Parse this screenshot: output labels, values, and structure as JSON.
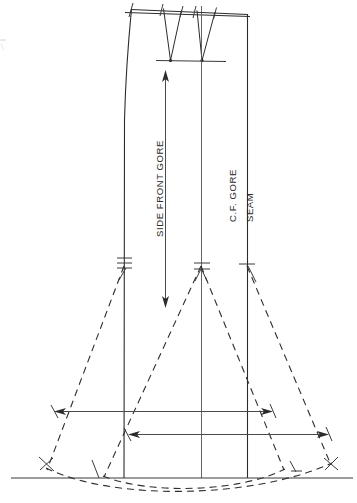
{
  "drawing": {
    "title": "Skirt Gore Pattern Draft",
    "type": "technical-sewing-pattern",
    "background_color": "#ffffff",
    "line_color": "#2b2b2b",
    "dashed_color": "#2e2e2e",
    "canvas": {
      "width": 357,
      "height": 503
    }
  },
  "labels": [
    {
      "id": "side-front-gore",
      "text": "SIDE FRONT GORE",
      "orientation": "vertical-up",
      "x": 163,
      "y": 237,
      "font_size": 9.5
    },
    {
      "id": "cf-gore",
      "text": "C.F. GORE",
      "orientation": "vertical-up",
      "x": 236,
      "y": 222,
      "font_size": 9.5
    },
    {
      "id": "seam",
      "text": "SEAM",
      "orientation": "vertical-up",
      "x": 253,
      "y": 222,
      "font_size": 9.5
    }
  ],
  "construction": {
    "waistline": {
      "y_left": 8,
      "y_right": 14,
      "x_left": 131,
      "x_right": 248
    },
    "hipline": {
      "y": 61,
      "x_left": 160,
      "x_right": 224
    },
    "baseline": {
      "y": 478,
      "x_left": 12,
      "x_right": 352
    },
    "vertical_lines": [
      {
        "id": "side-seam-line",
        "x": 124,
        "y_top": 10,
        "y_bottom": 478,
        "notches": 3
      },
      {
        "id": "side-front-gore-line",
        "x": 201,
        "y_top": 6,
        "y_bottom": 478,
        "notches": 2
      },
      {
        "id": "cf-gore-seam-line",
        "x": 247,
        "y_top": 14,
        "y_bottom": 478,
        "notches": 1
      }
    ],
    "darts": [
      {
        "id": "dart-left",
        "apex_x": 170,
        "apex_y": 61,
        "top_left_x": 163,
        "top_right_x": 181,
        "top_y": 8
      },
      {
        "id": "dart-right",
        "apex_x": 201,
        "apex_y": 61,
        "top_left_x": 197,
        "top_right_x": 215,
        "top_y": 8
      }
    ],
    "notch_row_y": 264,
    "flare_lines": [
      {
        "id": "flare-1",
        "from_x": 124,
        "from_y": 264,
        "to_x": 48,
        "to_y": 470
      },
      {
        "id": "flare-2",
        "from_x": 201,
        "from_y": 264,
        "to_x": 104,
        "to_y": 475
      },
      {
        "id": "flare-3",
        "from_x": 201,
        "from_y": 264,
        "to_x": 283,
        "to_y": 470
      },
      {
        "id": "flare-4",
        "from_x": 247,
        "from_y": 264,
        "to_x": 330,
        "to_y": 466
      }
    ],
    "hem_curves": [
      {
        "id": "hem-curve-outer",
        "start_x": 48,
        "start_y": 468,
        "end_x": 330,
        "end_y": 464,
        "sag": 498
      },
      {
        "id": "hem-curve-inner",
        "start_x": 104,
        "start_y": 474,
        "end_x": 283,
        "end_y": 470,
        "sag": 496
      }
    ]
  },
  "dimensions": [
    {
      "id": "sweep-measure-upper",
      "orientation": "horizontal",
      "y": 411,
      "x_start": 55,
      "x_end": 272,
      "arrow_start": true,
      "arrow_end": true
    },
    {
      "id": "sweep-measure-lower",
      "orientation": "horizontal",
      "y": 434,
      "x_start": 128,
      "x_end": 328,
      "arrow_start": true,
      "arrow_end": true
    },
    {
      "id": "gore-length-measure",
      "orientation": "vertical",
      "x": 165,
      "y_start": 70,
      "y_end": 307,
      "arrow_start": true,
      "arrow_end": true
    }
  ]
}
